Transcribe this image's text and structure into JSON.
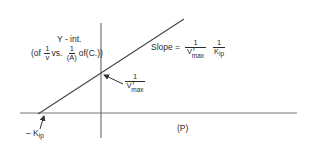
{
  "diagram": {
    "type": "line-plot-schematic",
    "colors": {
      "line": "#333333",
      "axis": "#555555",
      "text": "#2a2a2a",
      "background": "#ffffff"
    },
    "axes": {
      "x_label": "(P)",
      "x_intercept_label": {
        "prefix": "– K",
        "subscript": "ip"
      }
    },
    "y_intercept_annotation": {
      "title": "Y - int.",
      "line2_prefix": "(of",
      "frac1_num": "1",
      "frac1_den": "v",
      "vs": "vs.",
      "frac2_num": "1",
      "frac2_den": "(A)",
      "suffix": "of(C.))"
    },
    "y_intercept_value": {
      "num": "1",
      "den_base": "V",
      "den_sup": "f",
      "den_sub": "max"
    },
    "slope": {
      "prefix": "Slope =",
      "frac1_num": "1",
      "frac1_den_base": "V",
      "frac1_den_sup": "f",
      "frac1_den_sub": "max",
      "frac2_num": "1",
      "frac2_den_base": "K",
      "frac2_den_sub": "ip"
    }
  }
}
